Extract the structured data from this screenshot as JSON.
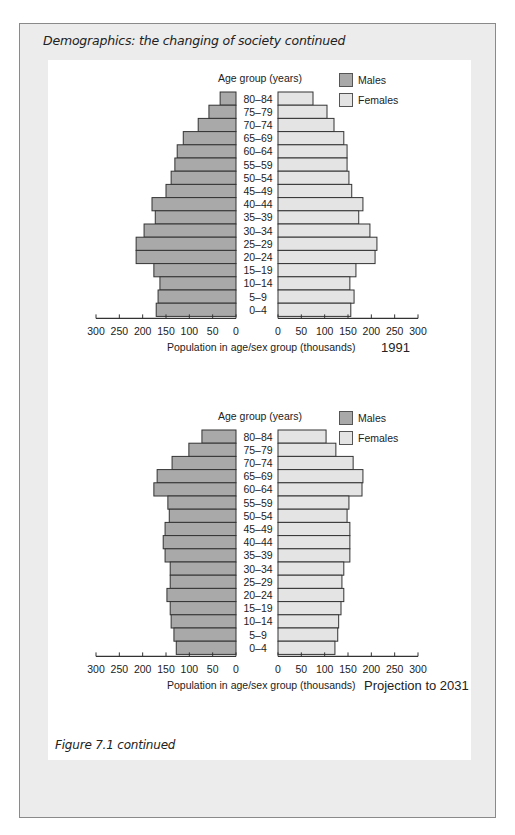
{
  "page": {
    "heading": "Demographics: the changing of society  continued",
    "figure_caption": "Figure 7.1  continued"
  },
  "colors": {
    "males": "#a9a9a9",
    "females": "#e4e4e4",
    "outline": "#333333",
    "frame_bg": "#ececec"
  },
  "chart_data": [
    {
      "type": "bar",
      "subtype": "population-pyramid",
      "title": "1991",
      "ylabel": "Age group (years)",
      "xlabel": "Population in age/sex group (thousands)",
      "x_ticks_left": [
        "300",
        "250",
        "200",
        "150",
        "100",
        "50",
        "0"
      ],
      "x_ticks_right": [
        "0",
        "50",
        "100",
        "150",
        "200",
        "250",
        "300"
      ],
      "xlim": [
        0,
        300
      ],
      "legend": [
        "Males",
        "Females"
      ],
      "legend_position": "top-right",
      "grid": false,
      "categories": [
        "80–84",
        "75–79",
        "70–74",
        "65–69",
        "60–64",
        "55–59",
        "50–54",
        "45–49",
        "40–44",
        "35–39",
        "30–34",
        "25–29",
        "20–24",
        "15–19",
        "10–14",
        "5–9",
        "0–4"
      ],
      "series": [
        {
          "name": "Males",
          "values": [
            34,
            58,
            81,
            113,
            126,
            131,
            139,
            150,
            180,
            173,
            197,
            214,
            214,
            176,
            163,
            167,
            171
          ]
        },
        {
          "name": "Females",
          "values": [
            75,
            105,
            120,
            141,
            148,
            148,
            152,
            158,
            182,
            173,
            197,
            212,
            208,
            167,
            154,
            163,
            156
          ]
        }
      ]
    },
    {
      "type": "bar",
      "subtype": "population-pyramid",
      "title": "Projection to 2031",
      "ylabel": "Age group (years)",
      "xlabel": "Population in age/sex group (thousands)",
      "x_ticks_left": [
        "300",
        "250",
        "200",
        "150",
        "100",
        "50",
        "0"
      ],
      "x_ticks_right": [
        "0",
        "50",
        "100",
        "150",
        "200",
        "250",
        "300"
      ],
      "xlim": [
        0,
        300
      ],
      "legend": [
        "Males",
        "Females"
      ],
      "legend_position": "top-right",
      "grid": false,
      "categories": [
        "80–84",
        "75–79",
        "70–74",
        "65–69",
        "60–64",
        "55–59",
        "50–54",
        "45–49",
        "40–44",
        "35–39",
        "30–34",
        "25–29",
        "20–24",
        "15–19",
        "10–14",
        "5–9",
        "0–4"
      ],
      "series": [
        {
          "name": "Males",
          "values": [
            73,
            101,
            137,
            169,
            176,
            146,
            143,
            152,
            156,
            152,
            141,
            141,
            148,
            141,
            139,
            133,
            128
          ]
        },
        {
          "name": "Females",
          "values": [
            103,
            124,
            161,
            182,
            180,
            152,
            148,
            154,
            154,
            154,
            141,
            137,
            141,
            135,
            130,
            128,
            122
          ]
        }
      ]
    }
  ]
}
